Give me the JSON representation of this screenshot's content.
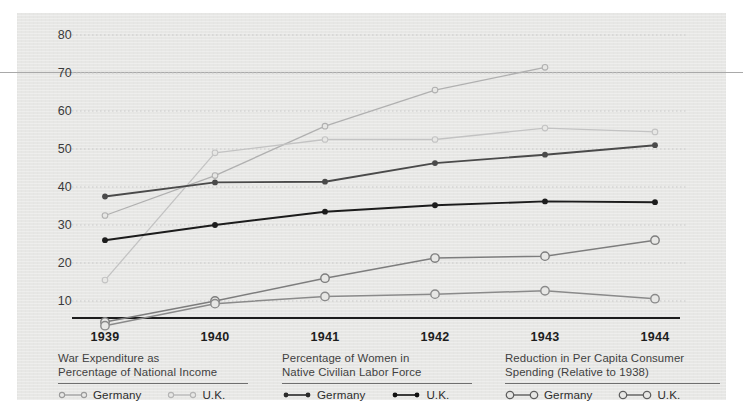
{
  "chart_data": {
    "type": "line",
    "title": "",
    "xlabel": "",
    "ylabel": "",
    "categories": [
      "1939",
      "1940",
      "1941",
      "1942",
      "1943",
      "1944"
    ],
    "x": [
      1939,
      1940,
      1941,
      1942,
      1943,
      1944
    ],
    "ylim": [
      0,
      85
    ],
    "yticks": [
      10,
      20,
      30,
      40,
      50,
      60,
      70,
      80
    ],
    "grid": true,
    "legend_position": "bottom",
    "series": [
      {
        "name": "War Expenditure as Percentage of National Income — Germany",
        "group": "War Expenditure as Percentage of National Income",
        "country": "Germany",
        "color": "#b0b0b0",
        "marker": "open-small",
        "values": [
          32.5,
          43,
          56,
          65.5,
          71.5,
          null
        ]
      },
      {
        "name": "War Expenditure as Percentage of National Income — U.K.",
        "group": "War Expenditure as Percentage of National Income",
        "country": "U.K.",
        "color": "#c3c3c3",
        "marker": "open-small",
        "values": [
          15.5,
          49,
          52.5,
          52.5,
          55.5,
          54.5
        ]
      },
      {
        "name": "Percentage of Women in Native Civilian Labor Force — Germany",
        "group": "Percentage of Women in Native Civilian Labor Force",
        "country": "Germany",
        "color": "#4a4a4a",
        "marker": "filled-small",
        "values": [
          37.5,
          41.2,
          41.4,
          46.3,
          48.5,
          51
        ]
      },
      {
        "name": "Percentage of Women in Native Civilian Labor Force — U.K.",
        "group": "Percentage of Women in Native Civilian Labor Force",
        "country": "U.K.",
        "color": "#1c1c1c",
        "marker": "filled-small",
        "values": [
          26,
          30,
          33.5,
          35.2,
          36.2,
          36
        ]
      },
      {
        "name": "Reduction in Per Capita Consumer Spending (Relative to 1938) — Germany",
        "group": "Reduction in Per Capita Consumer Spending (Relative to 1938)",
        "country": "Germany",
        "color": "#7d7d7d",
        "marker": "open-large",
        "values": [
          4.5,
          10,
          16,
          21.3,
          21.8,
          26
        ]
      },
      {
        "name": "Reduction in Per Capita Consumer Spending (Relative to 1938) — U.K.",
        "group": "Reduction in Per Capita Consumer Spending (Relative to 1938)",
        "country": "U.K.",
        "color": "#8a8a8a",
        "marker": "open-large",
        "values": [
          3.5,
          9.3,
          11.2,
          11.8,
          12.7,
          10.6
        ]
      }
    ]
  },
  "axis": {
    "y_ticks": [
      "80",
      "70",
      "60",
      "50",
      "40",
      "30",
      "20",
      "10"
    ],
    "x_ticks": [
      "1939",
      "1940",
      "1941",
      "1942",
      "1943",
      "1944"
    ]
  },
  "legends": [
    {
      "caption_line1": "War Expenditure as",
      "caption_line2": "Percentage of National Income",
      "keys": [
        {
          "label": "Germany",
          "style": "open-small",
          "color": "#9a9a9a"
        },
        {
          "label": "U.K.",
          "style": "open-small",
          "color": "#b4b4b4"
        }
      ]
    },
    {
      "caption_line1": "Percentage of Women in",
      "caption_line2": "Native Civilian Labor Force",
      "keys": [
        {
          "label": "Germany",
          "style": "filled-small",
          "color": "#2b2b2b"
        },
        {
          "label": "U.K.",
          "style": "filled-small",
          "color": "#111111"
        }
      ]
    },
    {
      "caption_line1": "Reduction in Per Capita Consumer",
      "caption_line2": "Spending (Relative to 1938)",
      "keys": [
        {
          "label": "Germany",
          "style": "open-large",
          "color": "#5f5f5f"
        },
        {
          "label": "U.K.",
          "style": "open-large",
          "color": "#5f5f5f"
        }
      ]
    }
  ],
  "colors": {
    "background": "#e7e7e5",
    "page": "#ffffff",
    "axis": "#1d1d1d",
    "grid": "#c9c9c9",
    "rule": "#a9a9a9"
  }
}
